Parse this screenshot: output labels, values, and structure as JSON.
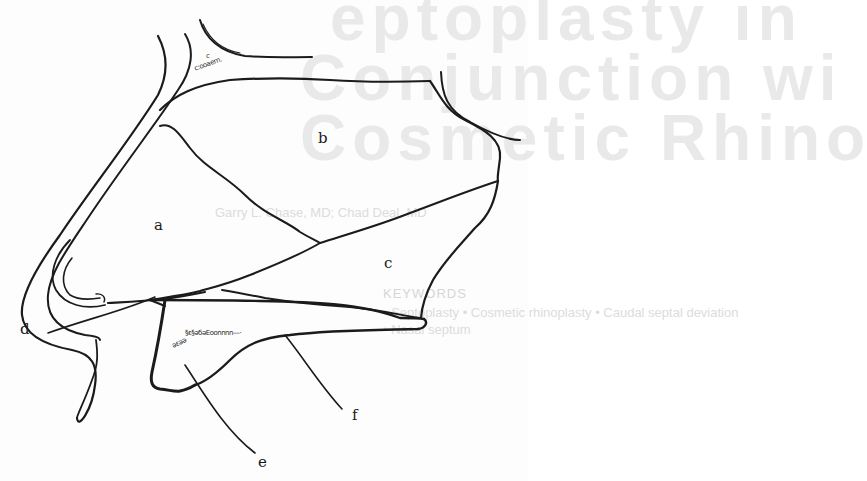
{
  "figure": {
    "type": "anatomical line drawing",
    "labels": {
      "a": "a",
      "b": "b",
      "c": "c",
      "d": "d",
      "e": "e",
      "f": "f"
    },
    "marrow_texture": {
      "top": "c:ooаеm.",
      "top_small": "c",
      "bone_upper": "§ε§əбəЕoonnnn—·",
      "bone_lower": "əεəə"
    },
    "colors": {
      "ink": "#1b1b1b",
      "background": "#fdfdfd",
      "bleed_through": "#e9e9e9"
    }
  },
  "bleed_through": {
    "title_line_1": "eptoplasty in",
    "title_line_2": "Conjunction wi",
    "title_line_3": "Cosmetic Rhino",
    "authors": "Garry L. Chase, MD; Chad Deal, MD",
    "keywords_heading": "KEYWORDS",
    "keywords_line_1": "• Septoplasty  •  Cosmetic rhinoplasty  •  Caudal septal deviation",
    "keywords_line_2": "• Nasal septum"
  }
}
